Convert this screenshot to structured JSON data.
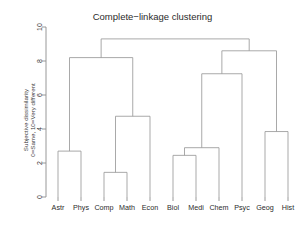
{
  "chart_data": {
    "type": "dendrogram",
    "title": "Complete−linkage clustering",
    "xlabel": "",
    "ylabel": "Subjective dissimilarity",
    "ylabel_line2": "0=Same, 10=Very different",
    "ylim": [
      0,
      10
    ],
    "yticks": [
      0,
      2,
      4,
      6,
      8,
      10
    ],
    "ytick_labels": [
      "0",
      "2",
      "4",
      "6",
      "8",
      "10"
    ],
    "grid": false,
    "legend": "none",
    "leaves": [
      "Astr",
      "Phys",
      "Comp",
      "Math",
      "Econ",
      "Biol",
      "Medi",
      "Chem",
      "Psyc",
      "Geog",
      "Hist"
    ],
    "leaf_count": 11,
    "merges": [
      {
        "id": "m1",
        "label": "Astr + Phys",
        "members": [
          "Astr",
          "Phys"
        ],
        "height": 2.7
      },
      {
        "id": "m2",
        "label": "Comp + Math",
        "members": [
          "Comp",
          "Math"
        ],
        "height": 1.45
      },
      {
        "id": "m3",
        "label": "(Comp,Math) + Econ",
        "members": [
          "Comp",
          "Math",
          "Econ"
        ],
        "height": 4.75
      },
      {
        "id": "m4",
        "label": "(Astr,Phys) + (Comp,Math,Econ)",
        "members": [
          "Astr",
          "Phys",
          "Comp",
          "Math",
          "Econ"
        ],
        "height": 8.2
      },
      {
        "id": "m5",
        "label": "Biol + Medi",
        "members": [
          "Biol",
          "Medi"
        ],
        "height": 2.45
      },
      {
        "id": "m6",
        "label": "(Biol,Medi) + Chem",
        "members": [
          "Biol",
          "Medi",
          "Chem"
        ],
        "height": 2.9
      },
      {
        "id": "m7",
        "label": "(Biol,Medi,Chem) + Psyc",
        "members": [
          "Biol",
          "Medi",
          "Chem",
          "Psyc"
        ],
        "height": 7.25
      },
      {
        "id": "m8",
        "label": "Geog + Hist",
        "members": [
          "Geog",
          "Hist"
        ],
        "height": 3.85
      },
      {
        "id": "m9",
        "label": "(Biol,Medi,Chem,Psyc) + (Geog,Hist)",
        "members": [
          "Biol",
          "Medi",
          "Chem",
          "Psyc",
          "Geog",
          "Hist"
        ],
        "height": 8.6
      },
      {
        "id": "m10",
        "label": "root",
        "members": [
          "Astr",
          "Phys",
          "Comp",
          "Math",
          "Econ",
          "Biol",
          "Medi",
          "Chem",
          "Psyc",
          "Geog",
          "Hist"
        ],
        "height": 9.3
      }
    ],
    "colors": {
      "line": "#9a9a9a",
      "axis": "#8c8c8c",
      "text": "#2b2b2b",
      "background": "#ffffff"
    }
  }
}
